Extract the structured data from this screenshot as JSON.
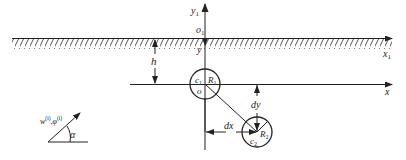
{
  "diagram": {
    "type": "geometry-schematic",
    "colors": {
      "stroke": "#222222",
      "background": "#ffffff"
    },
    "surface": {
      "label_x_axis": "x",
      "label_x_axis_sub": "1",
      "label_y_axis": "y",
      "label_y_axis_sub": "1",
      "label_origin": "o",
      "label_origin_sub": "1",
      "label_y_lower": "y"
    },
    "depth": {
      "label": "h"
    },
    "axes": {
      "label_x": "x",
      "label_origin": "o"
    },
    "cavity_1": {
      "center_label": "c",
      "center_sub": "1",
      "radius_label": "R",
      "radius_sub": "1"
    },
    "cavity_2": {
      "center_label": "c",
      "center_sub": "2",
      "radius_label": "R",
      "radius_sub": "2"
    },
    "offsets": {
      "dx_label": "dx",
      "dy_label": "dy"
    },
    "incident_wave": {
      "label_w": "w",
      "label_w_sup": "(i)",
      "sep": ",",
      "label_phi": "φ",
      "label_phi_sup": "(i)",
      "angle_label": "α"
    }
  }
}
